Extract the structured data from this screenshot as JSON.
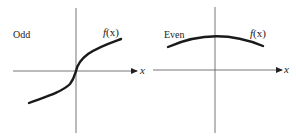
{
  "colors": {
    "axis": "#555555",
    "curve": "#1a1a1a",
    "text": "#1a1a1a",
    "background": "#ffffff"
  },
  "panels": [
    {
      "id": "odd",
      "label": "Odd",
      "function_label": "f(x)",
      "function_name": "f",
      "function_arg": "(x)",
      "axis_label": "x",
      "description": "Odd function: curve passes through origin, symmetric about origin (increasing S-shape)"
    },
    {
      "id": "even",
      "label": "Even",
      "function_label": "f(x)",
      "function_name": "f",
      "function_arg": "(x)",
      "axis_label": "x",
      "description": "Even function: downward-opening arc symmetric about the vertical axis, above x-axis"
    }
  ]
}
